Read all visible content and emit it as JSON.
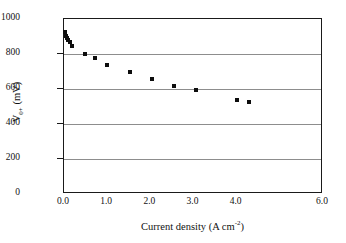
{
  "chart_data": {
    "type": "scatter",
    "title": "",
    "xlabel": "Current density (A cm-2)",
    "xlabel_prefix": "Current density (A cm",
    "xlabel_sup": "-2",
    "xlabel_suffix": ")",
    "ylabel": "V0+ (mV)",
    "ylabel_v": "V",
    "ylabel_sub": "0+",
    "ylabel_units": " (mV)",
    "xlim": [
      0.0,
      6.0
    ],
    "ylim": [
      0,
      1000
    ],
    "xticks": [
      "0.0",
      "1.0",
      "2.0",
      "3.0",
      "4.0",
      "6.0"
    ],
    "xtick_values": [
      0.0,
      1.0,
      2.0,
      3.0,
      4.0,
      6.0
    ],
    "yticks": [
      "0",
      "200",
      "400",
      "600",
      "800",
      "1000"
    ],
    "ytick_values": [
      0,
      200,
      400,
      600,
      800,
      1000
    ],
    "grid": "horizontal",
    "gridlines_y": [
      200,
      400,
      600,
      800
    ],
    "legend": null,
    "marker": "square",
    "marker_color": "#0d0d0d",
    "series": [
      {
        "name": "V0+ vs current density",
        "x": [
          0.02,
          0.05,
          0.07,
          0.09,
          0.13,
          0.19,
          0.48,
          0.72,
          1.0,
          1.52,
          2.05,
          2.55,
          3.05,
          4.0,
          4.28
        ],
        "y": [
          925,
          905,
          893,
          880,
          866,
          845,
          800,
          777,
          737,
          697,
          660,
          618,
          593,
          537,
          525
        ]
      }
    ]
  },
  "colors": {
    "axis": "#1a1a1a",
    "grid": "#8d8d8d",
    "marker": "#0d0d0d",
    "background": "#ffffff"
  }
}
